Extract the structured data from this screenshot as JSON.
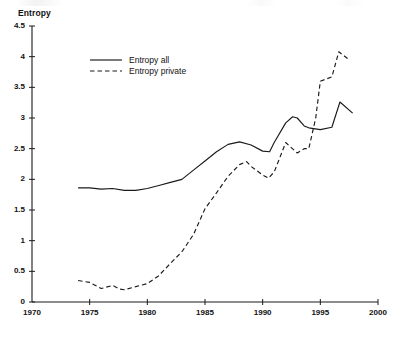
{
  "chart_data": {
    "type": "line",
    "title": "",
    "xlabel": "",
    "ylabel": "Entropy",
    "xlim": [
      1970,
      2000
    ],
    "ylim": [
      0,
      4.5
    ],
    "grid": false,
    "legend_position": "top-left-inside",
    "xticks": [
      "1970",
      "1975",
      "1980",
      "1985",
      "1990",
      "1995",
      "2000"
    ],
    "xtick_values": [
      1970,
      1975,
      1980,
      1985,
      1990,
      1995,
      2000
    ],
    "yticks": [
      "0",
      "0.5",
      "1",
      "1.5",
      "2",
      "2.5",
      "3",
      "3.5",
      "4",
      "4.5"
    ],
    "ytick_values": [
      0,
      0.5,
      1,
      1.5,
      2,
      2.5,
      3,
      3.5,
      4,
      4.5
    ],
    "series": [
      {
        "name": "Entropy all",
        "style": "solid",
        "color": "#1a1a1a",
        "x": [
          1974.0,
          1975.0,
          1976.0,
          1977.0,
          1978.0,
          1979.0,
          1980.0,
          1981.0,
          1982.0,
          1983.0,
          1984.0,
          1985.0,
          1986.0,
          1987.0,
          1988.0,
          1989.0,
          1990.0,
          1990.6,
          1991.0,
          1992.0,
          1992.6,
          1993.0,
          1993.6,
          1994.0,
          1995.0,
          1996.0,
          1996.7,
          1997.8
        ],
        "values": [
          1.86,
          1.86,
          1.84,
          1.85,
          1.82,
          1.82,
          1.85,
          1.9,
          1.95,
          2.0,
          2.15,
          2.3,
          2.45,
          2.57,
          2.61,
          2.56,
          2.46,
          2.45,
          2.6,
          2.92,
          3.02,
          3.0,
          2.87,
          2.84,
          2.81,
          2.85,
          3.26,
          3.08
        ]
      },
      {
        "name": "Entropy private",
        "style": "dashed",
        "color": "#1a1a1a",
        "x": [
          1974.0,
          1975.0,
          1976.0,
          1977.0,
          1977.6,
          1978.0,
          1979.0,
          1980.0,
          1981.0,
          1982.0,
          1983.0,
          1984.0,
          1985.0,
          1986.0,
          1987.0,
          1988.0,
          1988.6,
          1989.0,
          1990.0,
          1990.5,
          1991.0,
          1992.0,
          1992.4,
          1993.0,
          1993.6,
          1994.0,
          1994.6,
          1995.0,
          1996.0,
          1996.6,
          1997.5
        ],
        "values": [
          0.35,
          0.32,
          0.22,
          0.27,
          0.21,
          0.2,
          0.25,
          0.3,
          0.43,
          0.63,
          0.82,
          1.1,
          1.52,
          1.78,
          2.05,
          2.24,
          2.29,
          2.21,
          2.07,
          2.02,
          2.12,
          2.6,
          2.53,
          2.43,
          2.5,
          2.5,
          3.0,
          3.6,
          3.67,
          4.08,
          3.95
        ]
      }
    ]
  },
  "axis": {
    "y_title": "Entropy"
  },
  "legend": {
    "items": [
      {
        "label": "Entropy all",
        "style": "solid"
      },
      {
        "label": "Entropy private",
        "style": "dashed"
      }
    ]
  }
}
